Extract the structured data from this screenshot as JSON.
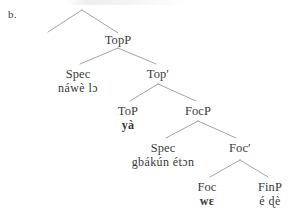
{
  "figure": {
    "example_label": "b.",
    "type": "syntax-tree",
    "language_note": "",
    "background_color": "#ffffff",
    "text_color": "#3a3a3c",
    "line_color": "#9a9a9c"
  },
  "tree": {
    "root_arc": {
      "name": "unlabeled-root-arc",
      "apex": [
        82,
        10
      ],
      "left_foot": [
        48,
        32
      ],
      "right_foot": [
        118,
        33
      ]
    },
    "nodes": [
      {
        "id": "topp",
        "label": "TopP",
        "terminal": "",
        "terminal_bold": false,
        "x": 118,
        "y": 33
      },
      {
        "id": "spec-top",
        "label": "Spec",
        "terminal": "náwè lɔ",
        "terminal_bold": false,
        "x": 78,
        "y": 67
      },
      {
        "id": "top-bar",
        "label": "Top′",
        "terminal": "",
        "terminal_bold": false,
        "x": 158,
        "y": 67
      },
      {
        "id": "to-p",
        "label": "ToP",
        "terminal": "yà",
        "terminal_bold": true,
        "x": 128,
        "y": 104
      },
      {
        "id": "focp",
        "label": "FocP",
        "terminal": "",
        "terminal_bold": false,
        "x": 198,
        "y": 104
      },
      {
        "id": "spec-foc",
        "label": "Spec",
        "terminal": "gbákún étɔn",
        "terminal_bold": false,
        "x": 163,
        "y": 141
      },
      {
        "id": "foc-bar",
        "label": "Foc′",
        "terminal": "",
        "terminal_bold": false,
        "x": 240,
        "y": 141
      },
      {
        "id": "foc",
        "label": "Foc",
        "terminal": "wɛ",
        "terminal_bold": true,
        "x": 207,
        "y": 180
      },
      {
        "id": "finp",
        "label": "FinP",
        "terminal": "é ɖè",
        "terminal_bold": false,
        "x": 270,
        "y": 180
      }
    ],
    "branches": [
      {
        "name": "topp-to-spec",
        "from": [
          118,
          48
        ],
        "to": [
          80,
          64
        ]
      },
      {
        "name": "topp-to-topbar",
        "from": [
          118,
          48
        ],
        "to": [
          156,
          64
        ]
      },
      {
        "name": "topbar-to-top",
        "from": [
          158,
          84
        ],
        "to": [
          130,
          101
        ]
      },
      {
        "name": "topbar-to-focp",
        "from": [
          158,
          84
        ],
        "to": [
          196,
          101
        ]
      },
      {
        "name": "focp-to-spec",
        "from": [
          198,
          121
        ],
        "to": [
          166,
          138
        ]
      },
      {
        "name": "focp-to-focbar",
        "from": [
          198,
          121
        ],
        "to": [
          236,
          138
        ]
      },
      {
        "name": "focbar-to-foc",
        "from": [
          240,
          160
        ],
        "to": [
          210,
          177
        ]
      },
      {
        "name": "focbar-to-finp",
        "from": [
          240,
          160
        ],
        "to": [
          268,
          177
        ]
      }
    ]
  }
}
